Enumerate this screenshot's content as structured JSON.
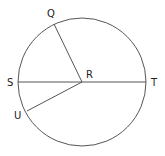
{
  "diagram": {
    "type": "circle-geometry",
    "circle": {
      "cx": 82,
      "cy": 82,
      "r": 64,
      "stroke": "#555555"
    },
    "center": {
      "label": "R",
      "x": 82,
      "y": 82
    },
    "points": [
      {
        "id": "Q",
        "label": "Q",
        "x": 54,
        "y": 24,
        "label_x": 47,
        "label_y": 17
      },
      {
        "id": "S",
        "label": "S",
        "x": 18,
        "y": 82,
        "label_x": 8,
        "label_y": 86
      },
      {
        "id": "T",
        "label": "T",
        "x": 146,
        "y": 82,
        "label_x": 151,
        "label_y": 86
      },
      {
        "id": "U",
        "label": "U",
        "x": 27,
        "y": 111,
        "label_x": 15,
        "label_y": 119
      }
    ],
    "segments": [
      {
        "from": "S",
        "to": "T",
        "name": "diameter-ST"
      },
      {
        "from": "R",
        "to": "Q",
        "name": "radius-RQ"
      },
      {
        "from": "R",
        "to": "U",
        "name": "radius-RU"
      }
    ],
    "labels": {
      "Q": "Q",
      "R": "R",
      "S": "S",
      "T": "T",
      "U": "U"
    }
  }
}
